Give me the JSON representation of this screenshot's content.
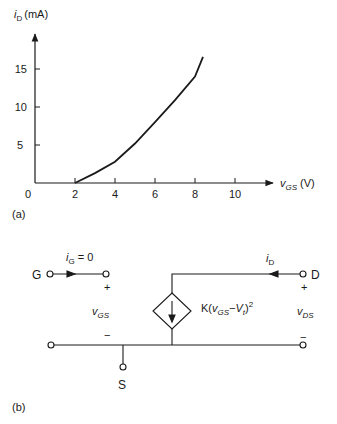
{
  "figure_a": {
    "caption": "(a)",
    "y_axis": {
      "var": "i",
      "sub": "D",
      "unit": "(mA)"
    },
    "x_axis": {
      "var": "v",
      "sub": "GS",
      "unit": "(V)"
    },
    "origin_label": "0",
    "x_ticks": [
      "2",
      "4",
      "6",
      "8",
      "10"
    ],
    "y_ticks": [
      "5",
      "10",
      "15"
    ]
  },
  "chart_data": {
    "type": "line",
    "title": "",
    "xlabel": "vGS (V)",
    "ylabel": "iD (mA)",
    "xlim": [
      0,
      12
    ],
    "ylim": [
      0,
      19
    ],
    "grid": false,
    "series": [
      {
        "name": "iD vs vGS (saturation)",
        "x": [
          2,
          3,
          4,
          5,
          6,
          7,
          8,
          8.4
        ],
        "values": [
          0,
          1.3,
          2.8,
          5.2,
          8.0,
          10.9,
          14.0,
          16.6
        ]
      }
    ],
    "x_ticks": [
      2,
      4,
      6,
      8,
      10
    ],
    "y_ticks": [
      5,
      10,
      15
    ]
  },
  "figure_b": {
    "caption": "(b)",
    "gate_label": "G",
    "drain_label": "D",
    "source_label": "S",
    "ig_var": "i",
    "ig_sub": "G",
    "ig_value": " = 0",
    "id_var": "i",
    "id_sub": "D",
    "vgs_var": "v",
    "vgs_sub": "GS",
    "vds_var": "v",
    "vds_sub": "DS",
    "plus": "+",
    "minus": "−",
    "source_expr": {
      "k": "K(",
      "v": "v",
      "vsub": "GS",
      "mid": "−V",
      "tsub": "t",
      "end": ")",
      "sup": "2"
    }
  }
}
